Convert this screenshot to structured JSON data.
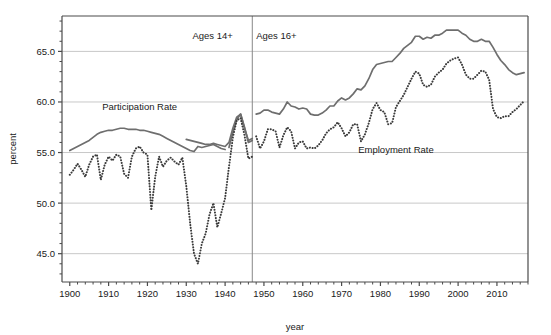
{
  "chart_data": {
    "type": "line",
    "title": "",
    "xlabel": "year",
    "ylabel": "percent",
    "xlim": [
      1898,
      2018
    ],
    "ylim": [
      42.2,
      68.5
    ],
    "grid": true,
    "grid_axis": "y",
    "legend": "inline-annotations",
    "xticks": [
      1900,
      1910,
      1920,
      1930,
      1940,
      1950,
      1960,
      1970,
      1980,
      1990,
      2000,
      2010
    ],
    "xtick_labels": [
      "1900",
      "1910",
      "1920",
      "1930",
      "1940",
      "1950",
      "1960",
      "1970",
      "1980",
      "1990",
      "2000",
      "2010"
    ],
    "xminor_step": 2,
    "yticks": [
      45.0,
      50.0,
      55.0,
      60.0,
      65.0
    ],
    "ytick_labels": [
      "45.0",
      "50.0",
      "55.0",
      "60.0",
      "65.0"
    ],
    "yminor_step": 1.0,
    "annotations": [
      {
        "name": "ages-14-plus",
        "text": "Ages 14+",
        "x": 1942,
        "y": 66.2,
        "anchor": "end"
      },
      {
        "name": "ages-16-plus",
        "text": "Ages 16+",
        "x": 1948,
        "y": 66.2,
        "anchor": "start"
      },
      {
        "name": "participation-rate-label",
        "text": "Participation Rate",
        "x": 1918,
        "y": 59.2,
        "anchor": "middle"
      },
      {
        "name": "employment-rate-label",
        "text": "Employment Rate",
        "x": 1984,
        "y": 55.0,
        "anchor": "middle"
      }
    ],
    "vertical_divider": {
      "x": 1947,
      "color": "#888888",
      "label": "series-break-1947"
    },
    "colors": {
      "participation": "#6e6e6e",
      "employment": "#3b3b3b",
      "grid": "#c8c8c8",
      "axis": "#4a4a4a",
      "text": "#1a1a1a"
    },
    "series": [
      {
        "name": "Participation Rate",
        "id": "participation-rate",
        "style": "solid",
        "color": "#6e6e6e",
        "segments": [
          {
            "label": "Ages 14+ (1900-1940)",
            "x": [
              1900,
              1901,
              1902,
              1903,
              1904,
              1905,
              1906,
              1907,
              1908,
              1909,
              1910,
              1911,
              1912,
              1913,
              1914,
              1915,
              1916,
              1917,
              1918,
              1919,
              1920,
              1921,
              1922,
              1923,
              1924,
              1925,
              1926,
              1927,
              1928,
              1929,
              1930,
              1931,
              1932,
              1933,
              1934,
              1935,
              1936,
              1937,
              1938,
              1939,
              1940
            ],
            "y": [
              55.2,
              55.4,
              55.6,
              55.8,
              56.0,
              56.2,
              56.5,
              56.8,
              57.0,
              57.1,
              57.2,
              57.2,
              57.3,
              57.4,
              57.4,
              57.3,
              57.3,
              57.3,
              57.2,
              57.2,
              57.1,
              57.0,
              56.9,
              56.8,
              56.6,
              56.4,
              56.2,
              56.0,
              55.8,
              55.6,
              55.4,
              55.2,
              55.1,
              55.6,
              55.5,
              55.6,
              55.7,
              55.8,
              55.6,
              55.4,
              55.3
            ]
          },
          {
            "label": "Ages 14+ (1941-1947)",
            "x": [
              1941,
              1942,
              1943,
              1944,
              1945,
              1946,
              1947
            ],
            "y": [
              55.5,
              57.0,
              58.3,
              58.8,
              57.5,
              56.0,
              56.2
            ]
          },
          {
            "label": "Ages 16+ (1930-1947 revised)",
            "x": [
              1930,
              1931,
              1932,
              1933,
              1934,
              1935,
              1936,
              1937,
              1938,
              1939,
              1940,
              1941,
              1942,
              1943,
              1944,
              1945,
              1946,
              1947
            ],
            "y": [
              56.3,
              56.2,
              56.1,
              56.0,
              55.9,
              55.8,
              55.8,
              55.9,
              55.8,
              55.7,
              55.6,
              56.0,
              57.4,
              58.5,
              58.8,
              57.4,
              56.2,
              56.4
            ]
          },
          {
            "label": "Ages 16+ (1948-2017)",
            "x": [
              1948,
              1949,
              1950,
              1951,
              1952,
              1953,
              1954,
              1955,
              1956,
              1957,
              1958,
              1959,
              1960,
              1961,
              1962,
              1963,
              1964,
              1965,
              1966,
              1967,
              1968,
              1969,
              1970,
              1971,
              1972,
              1973,
              1974,
              1975,
              1976,
              1977,
              1978,
              1979,
              1980,
              1981,
              1982,
              1983,
              1984,
              1985,
              1986,
              1987,
              1988,
              1989,
              1990,
              1991,
              1992,
              1993,
              1994,
              1995,
              1996,
              1997,
              1998,
              1999,
              2000,
              2001,
              2002,
              2003,
              2004,
              2005,
              2006,
              2007,
              2008,
              2009,
              2010,
              2011,
              2012,
              2013,
              2014,
              2015,
              2016,
              2017
            ],
            "y": [
              58.8,
              58.9,
              59.2,
              59.2,
              59.0,
              58.9,
              58.8,
              59.3,
              60.0,
              59.6,
              59.5,
              59.3,
              59.4,
              59.3,
              58.8,
              58.7,
              58.7,
              58.9,
              59.2,
              59.6,
              59.6,
              60.1,
              60.4,
              60.2,
              60.4,
              60.8,
              61.3,
              61.2,
              61.6,
              62.3,
              63.2,
              63.7,
              63.8,
              63.9,
              64.0,
              64.0,
              64.4,
              64.8,
              65.3,
              65.6,
              65.9,
              66.5,
              66.5,
              66.2,
              66.4,
              66.3,
              66.6,
              66.6,
              66.8,
              67.1,
              67.1,
              67.1,
              67.1,
              66.8,
              66.6,
              66.2,
              66.0,
              66.0,
              66.2,
              66.0,
              66.0,
              65.4,
              64.7,
              64.1,
              63.7,
              63.2,
              62.9,
              62.7,
              62.8,
              62.9
            ]
          }
        ]
      },
      {
        "name": "Employment Rate",
        "id": "employment-rate",
        "style": "dotted",
        "color": "#3b3b3b",
        "segments": [
          {
            "label": "Ages 14+ (1900-1947)",
            "x": [
              1900,
              1901,
              1902,
              1903,
              1904,
              1905,
              1906,
              1907,
              1908,
              1909,
              1910,
              1911,
              1912,
              1913,
              1914,
              1915,
              1916,
              1917,
              1918,
              1919,
              1920,
              1921,
              1922,
              1923,
              1924,
              1925,
              1926,
              1927,
              1928,
              1929,
              1930,
              1931,
              1932,
              1933,
              1934,
              1935,
              1936,
              1937,
              1938,
              1939,
              1940,
              1941,
              1942,
              1943,
              1944,
              1945,
              1946,
              1947
            ],
            "y": [
              52.8,
              53.3,
              53.9,
              53.3,
              52.6,
              53.8,
              54.6,
              54.8,
              52.3,
              53.8,
              54.6,
              54.2,
              54.8,
              54.6,
              52.9,
              52.5,
              54.6,
              55.4,
              55.6,
              55.0,
              54.8,
              49.3,
              52.6,
              54.6,
              53.6,
              54.2,
              54.5,
              54.1,
              53.8,
              54.5,
              51.7,
              48.0,
              45.0,
              44.0,
              46.0,
              47.0,
              48.9,
              50.0,
              47.6,
              49.0,
              50.5,
              53.6,
              56.5,
              58.2,
              58.4,
              56.7,
              54.4,
              54.6
            ]
          },
          {
            "label": "Ages 16+ (1948-2017)",
            "x": [
              1948,
              1949,
              1950,
              1951,
              1952,
              1953,
              1954,
              1955,
              1956,
              1957,
              1958,
              1959,
              1960,
              1961,
              1962,
              1963,
              1964,
              1965,
              1966,
              1967,
              1968,
              1969,
              1970,
              1971,
              1972,
              1973,
              1974,
              1975,
              1976,
              1977,
              1978,
              1979,
              1980,
              1981,
              1982,
              1983,
              1984,
              1985,
              1986,
              1987,
              1988,
              1989,
              1990,
              1991,
              1992,
              1993,
              1994,
              1995,
              1996,
              1997,
              1998,
              1999,
              2000,
              2001,
              2002,
              2003,
              2004,
              2005,
              2006,
              2007,
              2008,
              2009,
              2010,
              2011,
              2012,
              2013,
              2014,
              2015,
              2016,
              2017
            ],
            "y": [
              56.6,
              55.4,
              56.1,
              57.3,
              57.3,
              57.1,
              55.5,
              56.7,
              57.5,
              57.1,
              55.4,
              56.0,
              56.1,
              55.4,
              55.5,
              55.4,
              55.7,
              56.2,
              56.9,
              57.3,
              57.5,
              58.0,
              57.4,
              56.6,
              57.0,
              57.8,
              57.8,
              56.1,
              56.8,
              57.9,
              59.3,
              59.9,
              59.2,
              59.0,
              57.8,
              57.9,
              59.5,
              60.1,
              60.7,
              61.5,
              62.3,
              63.0,
              62.8,
              61.7,
              61.5,
              61.7,
              62.5,
              62.9,
              63.2,
              63.8,
              64.1,
              64.3,
              64.4,
              63.7,
              62.7,
              62.3,
              62.3,
              62.7,
              63.1,
              63.0,
              62.2,
              59.3,
              58.5,
              58.4,
              58.6,
              58.6,
              59.0,
              59.3,
              59.7,
              60.1
            ]
          }
        ]
      }
    ]
  },
  "axes": {
    "x_label": "year",
    "y_label": "percent"
  }
}
